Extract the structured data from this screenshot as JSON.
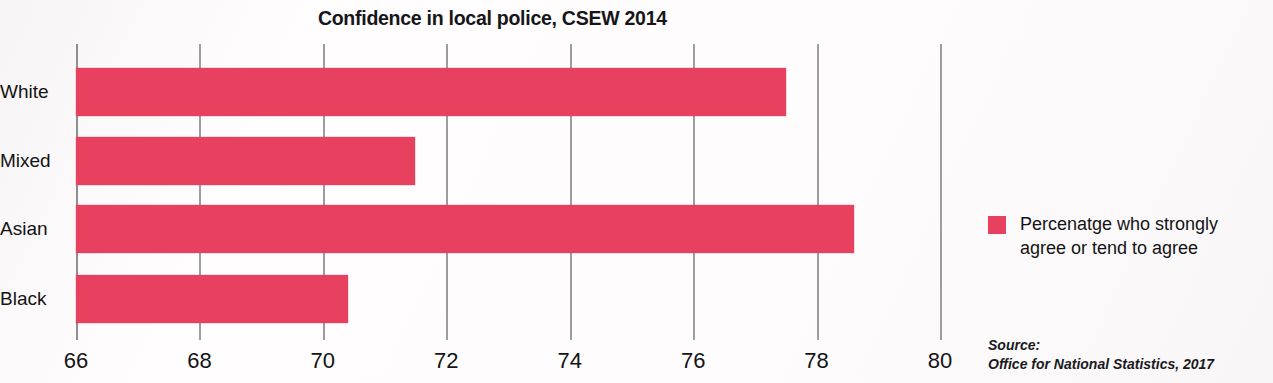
{
  "chart_data": {
    "type": "bar",
    "orientation": "horizontal",
    "title": "Confidence in local police, CSEW 2014",
    "categories": [
      "White",
      "Mixed",
      "Asian",
      "Black"
    ],
    "values": [
      77.5,
      71.5,
      78.6,
      70.4
    ],
    "series": [
      {
        "name": "Percenatge who strongly agree or tend to agree",
        "values": [
          77.5,
          71.5,
          78.6,
          70.4
        ]
      }
    ],
    "xlabel": "",
    "ylabel": "",
    "xlim": [
      66,
      80
    ],
    "xticks": [
      66,
      68,
      70,
      72,
      74,
      76,
      78,
      80
    ],
    "xtick_labels": [
      "66",
      "68",
      "70",
      "72",
      "74",
      "76",
      "78",
      "80"
    ],
    "grid": "vertical",
    "legend_position": "right",
    "bar_color": "#e8415f"
  },
  "legend": {
    "swatch_color": "#e8415f",
    "label": "Percenatge who strongly agree or tend to agree"
  },
  "source": {
    "line1": "Source:",
    "line2": "Office for National Statistics, 2017"
  }
}
